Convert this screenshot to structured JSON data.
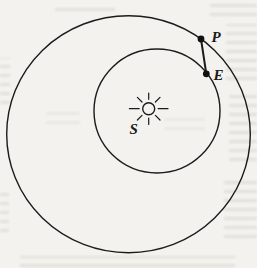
{
  "page": {
    "background_color": "#f3f2ee"
  },
  "diagram": {
    "type": "orbit-diagram",
    "sun": {
      "label": "S",
      "icon": "sun-icon"
    },
    "points": [
      {
        "label": "P",
        "on": "outer-circle"
      },
      {
        "label": "E",
        "on": "inner-circle"
      }
    ],
    "segment": {
      "from": "P",
      "to": "E"
    },
    "colors": {
      "line": "#1b1b1b",
      "dot": "#111111",
      "paper": "#f3f2ee"
    }
  }
}
